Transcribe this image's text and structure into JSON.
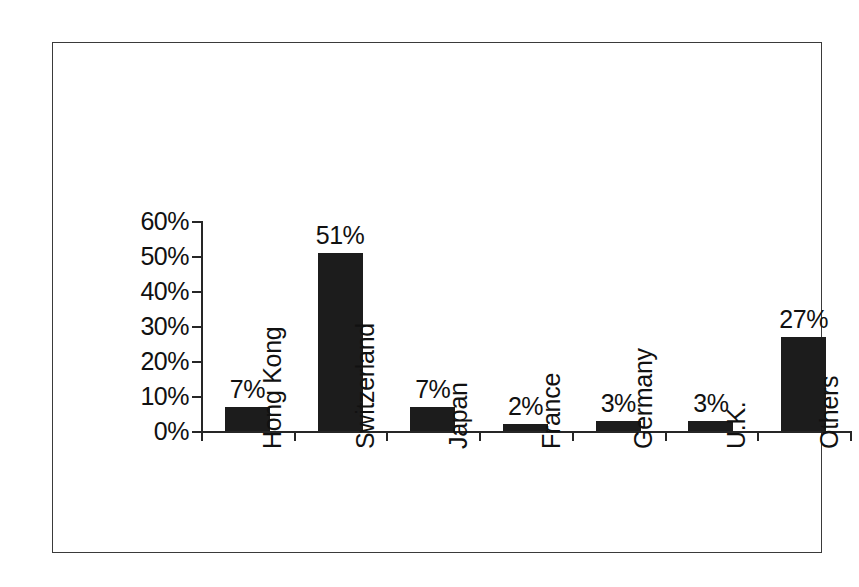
{
  "chart_data": {
    "type": "bar",
    "title": "",
    "subtitle": "",
    "xlabel": "",
    "ylabel": "",
    "categories": [
      "Hong Kong",
      "Switzerland",
      "Japan",
      "France",
      "Germany",
      "U.K.",
      "Others"
    ],
    "values": [
      7,
      51,
      7,
      2,
      3,
      3,
      27
    ],
    "value_labels": [
      "7%",
      "51%",
      "7%",
      "2%",
      "3%",
      "3%",
      "27%"
    ],
    "ylim": [
      0,
      60
    ],
    "ytick_values": [
      0,
      10,
      20,
      30,
      40,
      50,
      60
    ],
    "ytick_labels": [
      "0%",
      "10%",
      "20%",
      "30%",
      "40%",
      "50%",
      "60%"
    ],
    "grid": false,
    "legend": false,
    "legend_position": "none",
    "bar_color": "#1c1c1c",
    "axis_color": "#262626",
    "text_color": "#111111",
    "background_color": "#ffffff",
    "border_color": "#3a3a3a",
    "data_labels_shown": true,
    "value_unit": "%"
  }
}
